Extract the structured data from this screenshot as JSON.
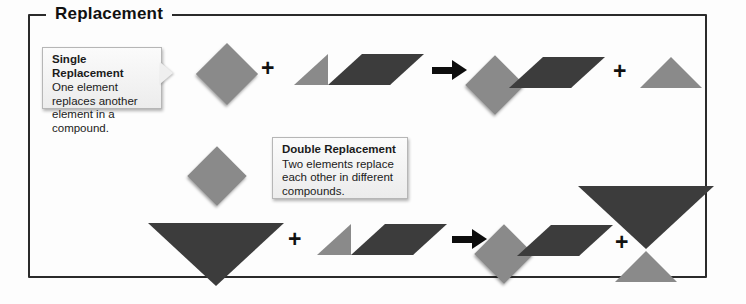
{
  "panel": {
    "legend": "Replacement"
  },
  "colors": {
    "light_gray": "#8a8a8a",
    "dark_gray": "#3c3c3c",
    "border": "#2b2b2b",
    "arrow": "#0d0d0d",
    "callout_bg": "#efefef",
    "background": "#fdfdfd"
  },
  "callouts": [
    {
      "id": "single",
      "title": "Single Replacement",
      "body": "One element replaces another element in a compound."
    },
    {
      "id": "double",
      "title": "Double Replacement",
      "body": "Two elements replace each other in different compounds."
    }
  ],
  "operators": {
    "plus": "+",
    "arrow": "yields-arrow"
  },
  "reactions": [
    {
      "name": "single-replacement",
      "reactants": [
        {
          "label": "lone-element-diamond",
          "shapes": [
            "gray-diamond"
          ]
        },
        {
          "label": "compound-triangle-parallelogram",
          "shapes": [
            "gray-triangle",
            "dark-parallelogram"
          ]
        }
      ],
      "products": [
        {
          "label": "new-compound-diamond-parallelogram",
          "shapes": [
            "gray-diamond",
            "dark-parallelogram"
          ]
        },
        {
          "label": "displaced-element-triangle",
          "shapes": [
            "gray-triangle"
          ]
        }
      ]
    },
    {
      "name": "double-replacement",
      "reactants": [
        {
          "label": "compound-diamond-big-triangle",
          "shapes": [
            "gray-diamond",
            "dark-down-triangle"
          ]
        },
        {
          "label": "compound-triangle-parallelogram",
          "shapes": [
            "gray-triangle",
            "dark-parallelogram"
          ]
        }
      ],
      "products": [
        {
          "label": "new-compound-diamond-parallelogram",
          "shapes": [
            "gray-diamond",
            "dark-parallelogram"
          ]
        },
        {
          "label": "new-compound-big-triangle-small-triangle",
          "shapes": [
            "dark-down-triangle",
            "gray-triangle"
          ]
        }
      ]
    }
  ]
}
